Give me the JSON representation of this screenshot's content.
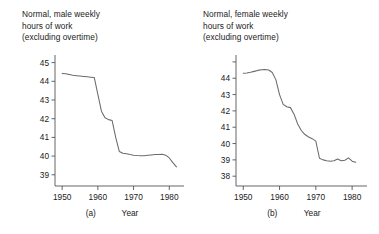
{
  "figure": {
    "background": "#ffffff",
    "line_color": "#6b6b6b",
    "axis_color": "#555555"
  },
  "panels": [
    {
      "key": "a",
      "letter": "(a)",
      "title_lines": [
        "Normal, male weekly",
        "hours of work",
        "(excluding overtime)"
      ]
    },
    {
      "key": "b",
      "letter": "(b)",
      "title_lines": [
        "Normal, female weekly",
        "hours of work",
        "(excluding overtime)"
      ]
    }
  ],
  "chart_data": [
    {
      "type": "line",
      "panel": "a",
      "title": "Normal, male weekly hours of work (excluding overtime)",
      "xlabel": "Year",
      "ylabel": "",
      "xlim": [
        1948,
        1983
      ],
      "ylim": [
        38.4,
        45.3
      ],
      "xticks": [
        1950,
        1960,
        1970,
        1980
      ],
      "yticks": [
        39,
        40,
        41,
        42,
        43,
        44,
        45
      ],
      "ytick_labels": [
        "39",
        "40",
        "41",
        "42",
        "43",
        "44",
        "45"
      ],
      "xtick_labels": [
        "1950",
        "1960",
        "1970",
        "1980"
      ],
      "grid": false,
      "legend": "none",
      "series": [
        {
          "name": "Normal male weekly hours",
          "x": [
            1950,
            1951,
            1952,
            1953,
            1954,
            1955,
            1956,
            1957,
            1958,
            1959,
            1960,
            1961,
            1962,
            1963,
            1964,
            1965,
            1966,
            1967,
            1968,
            1969,
            1970,
            1971,
            1972,
            1973,
            1974,
            1975,
            1976,
            1977,
            1978,
            1979,
            1980,
            1981,
            1982
          ],
          "values": [
            44.42,
            44.4,
            44.36,
            44.32,
            44.3,
            44.28,
            44.26,
            44.24,
            44.22,
            44.2,
            43.3,
            42.4,
            42.05,
            41.95,
            41.9,
            41.0,
            40.25,
            40.15,
            40.12,
            40.08,
            40.05,
            40.03,
            40.02,
            40.02,
            40.04,
            40.06,
            40.08,
            40.09,
            40.1,
            40.05,
            39.9,
            39.65,
            39.42
          ]
        }
      ]
    },
    {
      "type": "line",
      "panel": "b",
      "title": "Normal, female weekly hours of work (excluding overtime)",
      "xlabel": "Year",
      "ylabel": "",
      "xlim": [
        1948,
        1983
      ],
      "ylim": [
        37.4,
        45.3
      ],
      "xticks": [
        1950,
        1960,
        1970,
        1980
      ],
      "yticks": [
        38,
        39,
        40,
        41,
        42,
        43,
        44,
        45
      ],
      "ytick_labels": [
        "38",
        "39",
        "40",
        "41",
        "42",
        "43",
        "44",
        ""
      ],
      "xtick_labels": [
        "1950",
        "1960",
        "1970",
        "1980"
      ],
      "grid": false,
      "legend": "none",
      "series": [
        {
          "name": "Normal female weekly hours",
          "x": [
            1950,
            1951,
            1952,
            1953,
            1954,
            1955,
            1956,
            1957,
            1958,
            1959,
            1960,
            1961,
            1962,
            1963,
            1964,
            1965,
            1966,
            1967,
            1968,
            1969,
            1970,
            1971,
            1972,
            1973,
            1974,
            1975,
            1976,
            1977,
            1978,
            1979,
            1980,
            1981
          ],
          "values": [
            44.3,
            44.32,
            44.36,
            44.42,
            44.48,
            44.52,
            44.54,
            44.5,
            44.35,
            43.9,
            43.0,
            42.4,
            42.25,
            42.2,
            41.8,
            41.2,
            40.8,
            40.55,
            40.4,
            40.3,
            40.15,
            39.1,
            39.0,
            38.95,
            38.92,
            38.95,
            39.05,
            38.95,
            38.98,
            39.12,
            38.92,
            38.85
          ]
        }
      ]
    }
  ]
}
